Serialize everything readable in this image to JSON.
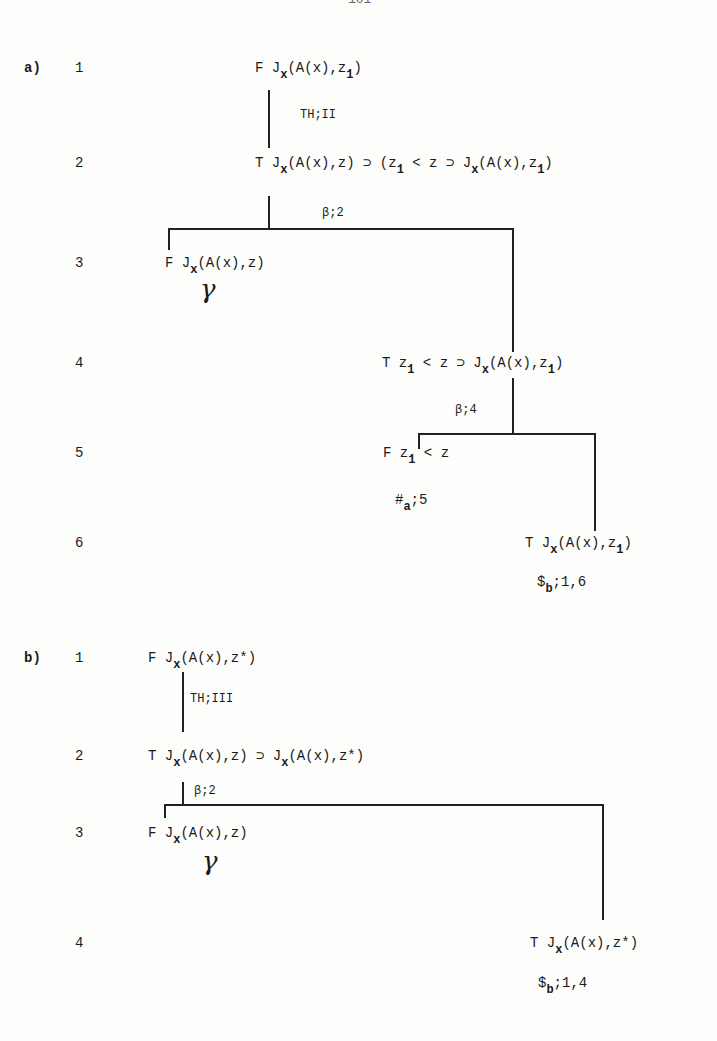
{
  "page": {
    "page_number_partial": "101"
  },
  "tableau_a": {
    "label": "a)",
    "rows": [
      {
        "num": "1",
        "sign": "F",
        "pre": "J",
        "sub1": "x",
        "post": "(A(x),z",
        "sub2": "1",
        "end": ")"
      },
      {
        "num": "2",
        "sign": "T",
        "pre": "J",
        "sub1": "x",
        "post": "(A(x),z) ⊃ (z",
        "sub2": "1",
        "mid": " < z ⊃ J",
        "sub3": "x",
        "post2": "(A(x),z",
        "sub4": "1",
        "end": ")"
      },
      {
        "num": "3",
        "sign": "F",
        "pre": "J",
        "sub1": "x",
        "post": "(A(x),z)",
        "mark": "γ"
      },
      {
        "num": "4",
        "sign": "T",
        "pre": "z",
        "sub1": "1",
        "post": " < z ⊃ J",
        "sub2": "x",
        "post2": "(A(x),z",
        "sub3": "1",
        "end": ")"
      },
      {
        "num": "5",
        "sign": "F",
        "pre": "z",
        "sub1": "1",
        "post": " < z",
        "note_pre": "#",
        "note_sub": "a",
        "note_post": ";5"
      },
      {
        "num": "6",
        "sign": "T",
        "pre": "J",
        "sub1": "x",
        "post": "(A(x),z",
        "sub2": "1",
        "end": ")",
        "note_pre": "$",
        "note_sub": "b",
        "note_post": ";1,6"
      }
    ],
    "rules": {
      "r1": "TH;II",
      "r2": "β;2",
      "r3": "β;4"
    }
  },
  "tableau_b": {
    "label": "b)",
    "rows": [
      {
        "num": "1",
        "sign": "F",
        "pre": "J",
        "sub1": "x",
        "post": "(A(x),z*)"
      },
      {
        "num": "2",
        "sign": "T",
        "pre": "J",
        "sub1": "x",
        "post": "(A(x),z) ⊃ J",
        "sub2": "x",
        "post2": "(A(x),z*)"
      },
      {
        "num": "3",
        "sign": "F",
        "pre": "J",
        "sub1": "x",
        "post": "(A(x),z)",
        "mark": "γ"
      },
      {
        "num": "4",
        "sign": "T",
        "pre": "J",
        "sub1": "x",
        "post": "(A(x),z*)",
        "note_pre": "$",
        "note_sub": "b",
        "note_post": ";1,4"
      }
    ],
    "rules": {
      "r1": "TH;III",
      "r2": "β;2"
    }
  }
}
